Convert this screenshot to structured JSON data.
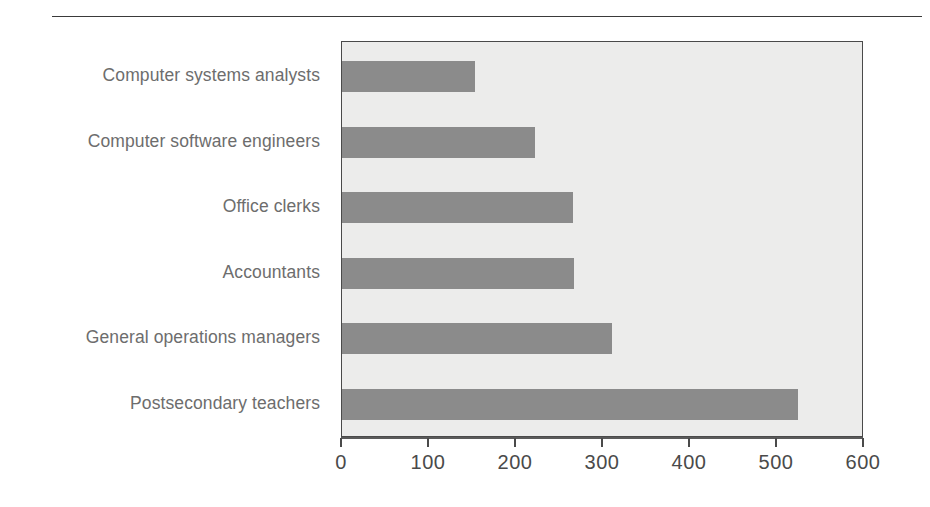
{
  "figure": {
    "background_color": "#ffffff",
    "rule_color": "#3a3a3a",
    "plot_background_color": "#ececeb",
    "plot_border_color": "#4a4a4a",
    "bar_color": "#8b8b8b",
    "label_color": "#6d6d6d",
    "tick_color": "#4a4a4a"
  },
  "chart_data": {
    "type": "bar",
    "orientation": "horizontal",
    "title": "",
    "subtitle": "",
    "xlabel": "",
    "ylabel": "",
    "categories": [
      "Computer systems analysts",
      "Computer software engineers",
      "Office clerks",
      "Accountants",
      "General operations managers",
      "Postsecondary teachers"
    ],
    "values": [
      153,
      222,
      266,
      267,
      310,
      524
    ],
    "xlim": [
      0,
      600
    ],
    "xticks": [
      0,
      100,
      200,
      300,
      400,
      500,
      600
    ],
    "xtick_labels": [
      "0",
      "100",
      "200",
      "300",
      "400",
      "500",
      "600"
    ],
    "grid": false,
    "legend": null,
    "legend_position": "none",
    "series": [
      {
        "name": "",
        "values": [
          153,
          222,
          266,
          267,
          310,
          524
        ]
      }
    ]
  }
}
